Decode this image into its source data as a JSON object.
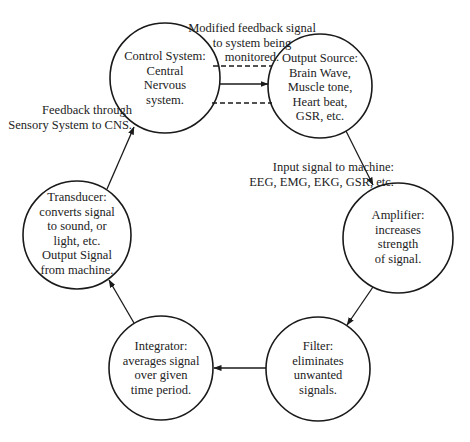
{
  "diagram": {
    "type": "biofeedback-loop",
    "colors": {
      "stroke": "#1a1a1a",
      "text": "#222222",
      "background": "#ffffff"
    },
    "nodes": [
      {
        "id": "control",
        "label": "Control System:\nCentral\nNervous\nsystem."
      },
      {
        "id": "output_source",
        "label": "Output Source:\nBrain Wave,\nMuscle tone,\nHeart beat,\nGSR, etc."
      },
      {
        "id": "amplifier",
        "label": "Amplifier:\nincreases strength\nof signal."
      },
      {
        "id": "filter",
        "label": "Filter:\neliminates\nunwanted\nsignals."
      },
      {
        "id": "integrator",
        "label": "Integrator:\naverages signal\nover given\ntime period."
      },
      {
        "id": "transducer",
        "label": "Transducer:\nconverts signal\nto sound, or\nlight, etc.\nOutput Signal\nfrom machine."
      }
    ],
    "edges": [
      {
        "from": "control",
        "to": "output_source",
        "style": "solid",
        "label": "Modified feedback signal\nto system being\nmonitored."
      },
      {
        "from": "control",
        "to": "output_source",
        "style": "dashed-pair",
        "label": ""
      },
      {
        "from": "output_source",
        "to": "amplifier",
        "style": "solid",
        "label": "Input signal to machine:\nEEG, EMG, EKG, GSR, etc."
      },
      {
        "from": "amplifier",
        "to": "filter",
        "style": "solid",
        "label": ""
      },
      {
        "from": "filter",
        "to": "integrator",
        "style": "solid",
        "label": ""
      },
      {
        "from": "integrator",
        "to": "transducer",
        "style": "solid",
        "label": ""
      },
      {
        "from": "transducer",
        "to": "control",
        "style": "solid",
        "label": "Feedback through\nSensory System to CNS."
      }
    ]
  }
}
